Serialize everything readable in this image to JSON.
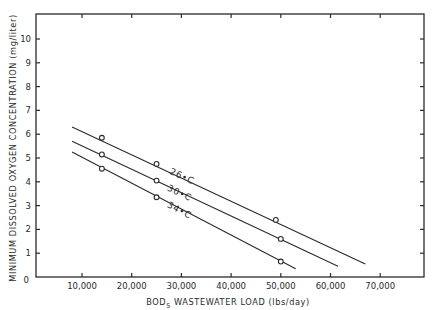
{
  "chart_data": {
    "type": "line",
    "title": "",
    "xlabel": "BOD5 WASTEWATER LOAD (lbs/day)",
    "xlabel_main": "BOD",
    "xlabel_sub": "5",
    "xlabel_rest": " WASTEWATER LOAD (lbs/day)",
    "ylabel": "MINIMUM DISSOLVED OXYGEN CONCENTRATION (mg/liter)",
    "xlim": [
      800,
      79000
    ],
    "ylim": [
      0,
      10.5
    ],
    "x_ticks": [
      10000,
      20000,
      30000,
      40000,
      50000,
      60000,
      70000
    ],
    "x_tick_labels": [
      "10,000",
      "20,000",
      "30,000",
      "40,000",
      "50,000",
      "60,000",
      "70,000"
    ],
    "y_ticks": [
      0,
      1,
      2,
      3,
      4,
      5,
      6,
      7,
      8,
      9,
      10
    ],
    "y_tick_labels": [
      "0",
      "1",
      "2",
      "3",
      "4",
      "5",
      "6",
      "7",
      "8",
      "9",
      "10"
    ],
    "grid": false,
    "legend": "inline labels on lines",
    "series": [
      {
        "name": "26°C",
        "label": "26•C",
        "points": [
          {
            "x": 14000,
            "y": 5.85
          },
          {
            "x": 25000,
            "y": 4.75
          },
          {
            "x": 49000,
            "y": 2.4
          }
        ],
        "line_start": {
          "x": 8000,
          "y": 6.3
        },
        "line_end": {
          "x": 67000,
          "y": 0.55
        },
        "label_pos": {
          "x": 27500,
          "y": 4.35
        }
      },
      {
        "name": "30°C",
        "label": "30•C",
        "points": [
          {
            "x": 14000,
            "y": 5.15
          },
          {
            "x": 25000,
            "y": 4.05
          },
          {
            "x": 50000,
            "y": 1.6
          }
        ],
        "line_start": {
          "x": 8000,
          "y": 5.7
        },
        "line_end": {
          "x": 61500,
          "y": 0.45
        },
        "label_pos": {
          "x": 27000,
          "y": 3.65
        }
      },
      {
        "name": "34°C",
        "label": "34•C",
        "points": [
          {
            "x": 14000,
            "y": 4.55
          },
          {
            "x": 25000,
            "y": 3.35
          },
          {
            "x": 50000,
            "y": 0.65
          }
        ],
        "line_start": {
          "x": 8000,
          "y": 5.25
        },
        "line_end": {
          "x": 53000,
          "y": 0.35
        },
        "label_pos": {
          "x": 27000,
          "y": 2.95
        }
      }
    ]
  }
}
